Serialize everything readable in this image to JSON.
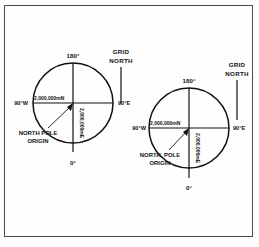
{
  "figure": {
    "background_color": "#fefefe",
    "frame_color": "#4a4a4a",
    "ink_color": "#111111"
  },
  "diagrams": [
    {
      "id": "left",
      "name": "north-zone-ups-grid",
      "grid_north_label_line1": "GRID",
      "grid_north_label_line2": "NORTH",
      "top_degree": "180°",
      "bottom_degree": "0°",
      "left_degree": "90°W",
      "right_degree": "90°E",
      "northing_label": "2,000,000mN",
      "easting_label": "2,000,000mE",
      "origin_label_line1": "NORTH POLE",
      "origin_label_line2": "ORIGIN"
    },
    {
      "id": "right",
      "name": "south-zone-ups-grid",
      "grid_north_label_line1": "GRID",
      "grid_north_label_line2": "NORTH",
      "top_degree": "180°",
      "bottom_degree": "0°",
      "left_degree": "90°W",
      "right_degree": "90°E",
      "northing_label": "2,000,000mN",
      "easting_label": "2,000,000mE",
      "origin_label_line1": "NORTH, POLE",
      "origin_label_line2": "ORIGIN"
    }
  ]
}
